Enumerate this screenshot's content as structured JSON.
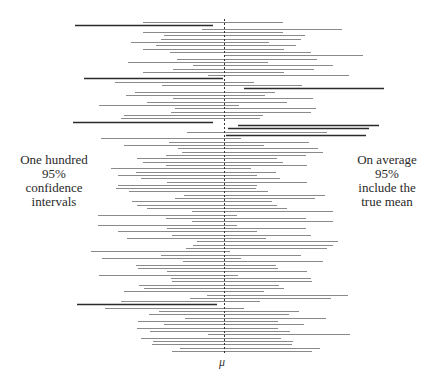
{
  "chart_data": {
    "type": "interval",
    "title": "",
    "xlabel": "μ",
    "ylabel": "",
    "true_mean_x": 224,
    "row_top": 22,
    "row_bottom": 351,
    "colors": {
      "hit": "#8a8a8a",
      "miss": "#2b2b2b",
      "mean_line": "#333333"
    },
    "annotations": {
      "left": [
        "One hundred",
        "95%",
        "confidence",
        "intervals"
      ],
      "right": [
        "On average",
        "95%",
        "include the",
        "true mean"
      ]
    },
    "intervals": [
      [
        143,
        283
      ],
      [
        75,
        213
      ],
      [
        202,
        342
      ],
      [
        143,
        283
      ],
      [
        164,
        305
      ],
      [
        161,
        301
      ],
      [
        131,
        269
      ],
      [
        156,
        296
      ],
      [
        143,
        284
      ],
      [
        170,
        311
      ],
      [
        224,
        363
      ],
      [
        177,
        317
      ],
      [
        128,
        268
      ],
      [
        193,
        333
      ],
      [
        173,
        314
      ],
      [
        143,
        284
      ],
      [
        208,
        349
      ],
      [
        84,
        223
      ],
      [
        115,
        254
      ],
      [
        162,
        302
      ],
      [
        244,
        384
      ],
      [
        135,
        275
      ],
      [
        126,
        265
      ],
      [
        173,
        313
      ],
      [
        147,
        287
      ],
      [
        99,
        239
      ],
      [
        175,
        316
      ],
      [
        171,
        311
      ],
      [
        124,
        263
      ],
      [
        121,
        260
      ],
      [
        73,
        213
      ],
      [
        238,
        379
      ],
      [
        228,
        369
      ],
      [
        187,
        327
      ],
      [
        226,
        366
      ],
      [
        101,
        241
      ],
      [
        169,
        309
      ],
      [
        124,
        264
      ],
      [
        178,
        318
      ],
      [
        182,
        323
      ],
      [
        166,
        306
      ],
      [
        137,
        277
      ],
      [
        143,
        283
      ],
      [
        166,
        307
      ],
      [
        111,
        251
      ],
      [
        136,
        276
      ],
      [
        118,
        257
      ],
      [
        141,
        280
      ],
      [
        167,
        307
      ],
      [
        118,
        257
      ],
      [
        116,
        256
      ],
      [
        129,
        268
      ],
      [
        184,
        325
      ],
      [
        175,
        315
      ],
      [
        132,
        272
      ],
      [
        137,
        277
      ],
      [
        147,
        287
      ],
      [
        192,
        333
      ],
      [
        98,
        237
      ],
      [
        166,
        306
      ],
      [
        192,
        333
      ],
      [
        98,
        237
      ],
      [
        167,
        306
      ],
      [
        118,
        257
      ],
      [
        172,
        311
      ],
      [
        127,
        266
      ],
      [
        197,
        338
      ],
      [
        193,
        333
      ],
      [
        186,
        327
      ],
      [
        91,
        230
      ],
      [
        161,
        301
      ],
      [
        102,
        241
      ],
      [
        183,
        323
      ],
      [
        136,
        276
      ],
      [
        138,
        278
      ],
      [
        167,
        307
      ],
      [
        99,
        238
      ],
      [
        171,
        311
      ],
      [
        172,
        312
      ],
      [
        139,
        279
      ],
      [
        144,
        284
      ],
      [
        124,
        264
      ],
      [
        207,
        348
      ],
      [
        190,
        331
      ],
      [
        121,
        260
      ],
      [
        77,
        217
      ],
      [
        105,
        244
      ],
      [
        159,
        299
      ],
      [
        149,
        289
      ],
      [
        185,
        326
      ],
      [
        138,
        278
      ],
      [
        164,
        304
      ],
      [
        137,
        278
      ],
      [
        150,
        290
      ],
      [
        208,
        350
      ],
      [
        141,
        281
      ],
      [
        153,
        293
      ],
      [
        152,
        292
      ],
      [
        180,
        320
      ],
      [
        172,
        312
      ]
    ],
    "misses_count": 7,
    "legend": null,
    "grid": false
  },
  "labels": {
    "left_line1": "One hundred",
    "left_line2": "95%",
    "left_line3": "confidence",
    "left_line4": "intervals",
    "right_line1": "On average",
    "right_line2": "95%",
    "right_line3": "include the",
    "right_line4": "true mean",
    "mu": "μ"
  }
}
